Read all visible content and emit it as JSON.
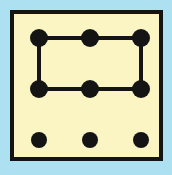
{
  "figure": {
    "title": "Nine-dot grid with rectangle connecting six dots",
    "type": "dot-grid-diagram",
    "canvas": {
      "width": 172,
      "height": 175
    },
    "colors": {
      "page_background": "#ade1f2",
      "panel_fill": "#faf5c3",
      "panel_border": "#141414",
      "dot_fill": "#141414",
      "line_stroke": "#141414"
    },
    "panel": {
      "x": 10,
      "y": 10,
      "width": 153,
      "height": 151,
      "border_width": 4
    },
    "grid": {
      "rows": 3,
      "columns": 3,
      "column_x": [
        39,
        90,
        141
      ],
      "row_y": [
        38,
        89,
        140
      ],
      "dot_radius_connected": 9,
      "dot_radius_free": 8
    },
    "dots": [
      {
        "id": "dot-r1c1",
        "label": "top-left",
        "cx": 39,
        "cy": 38,
        "r": 9,
        "connected": true
      },
      {
        "id": "dot-r1c2",
        "label": "top-center",
        "cx": 90,
        "cy": 38,
        "r": 9,
        "connected": true
      },
      {
        "id": "dot-r1c3",
        "label": "top-right",
        "cx": 141,
        "cy": 38,
        "r": 9,
        "connected": true
      },
      {
        "id": "dot-r2c1",
        "label": "middle-left",
        "cx": 39,
        "cy": 89,
        "r": 9,
        "connected": true
      },
      {
        "id": "dot-r2c2",
        "label": "middle-center",
        "cx": 90,
        "cy": 89,
        "r": 9,
        "connected": true
      },
      {
        "id": "dot-r2c3",
        "label": "middle-right",
        "cx": 141,
        "cy": 89,
        "r": 9,
        "connected": true
      },
      {
        "id": "dot-r3c1",
        "label": "bottom-left",
        "cx": 39,
        "cy": 140,
        "r": 8,
        "connected": false
      },
      {
        "id": "dot-r3c2",
        "label": "bottom-center",
        "cx": 90,
        "cy": 140,
        "r": 8,
        "connected": false
      },
      {
        "id": "dot-r3c3",
        "label": "bottom-right",
        "cx": 141,
        "cy": 140,
        "r": 8,
        "connected": false
      }
    ],
    "segments": [
      {
        "id": "segment-top",
        "label": "top edge",
        "x1": 39,
        "y1": 38,
        "x2": 141,
        "y2": 38,
        "width": 4
      },
      {
        "id": "segment-right",
        "label": "right edge",
        "x1": 141,
        "y1": 38,
        "x2": 141,
        "y2": 89,
        "width": 4
      },
      {
        "id": "segment-bottom",
        "label": "bottom edge",
        "x1": 141,
        "y1": 89,
        "x2": 39,
        "y2": 89,
        "width": 4
      },
      {
        "id": "segment-left",
        "label": "left edge",
        "x1": 39,
        "y1": 89,
        "x2": 39,
        "y2": 38,
        "width": 4
      }
    ]
  }
}
